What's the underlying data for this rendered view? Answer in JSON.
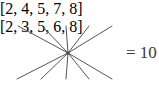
{
  "figure": {
    "width": 159,
    "height": 107,
    "background_color": "#ffffff",
    "line_color": "#555555",
    "text_color": "#2b2b2b",
    "result_color": "#3a3a3a"
  },
  "top_list": {
    "label": "[2, 4, 5, 7, 8]",
    "values": [
      2,
      4,
      5,
      7,
      8
    ]
  },
  "bottom_list": {
    "label": "[2, 3, 5, 6, 8]",
    "values": [
      2,
      3,
      5,
      6,
      8
    ]
  },
  "result": {
    "label": "= 10",
    "operator": "=",
    "value": 10
  },
  "chart_data": {
    "type": "diagram",
    "subtype": "radial-crossing-lines",
    "title": "",
    "convergence_point": {
      "x": 68,
      "y": 53
    },
    "top_anchors": [
      {
        "label": "2",
        "x": 18,
        "y": 26
      },
      {
        "label": "4",
        "x": 42,
        "y": 26
      },
      {
        "label": "5",
        "x": 66,
        "y": 26
      },
      {
        "label": "7",
        "x": 89,
        "y": 26
      },
      {
        "label": "8",
        "x": 112,
        "y": 26
      }
    ],
    "bottom_anchors": [
      {
        "label": "2",
        "x": 17,
        "y": 79
      },
      {
        "label": "3",
        "x": 41,
        "y": 79
      },
      {
        "label": "5",
        "x": 66,
        "y": 79
      },
      {
        "label": "6",
        "x": 89,
        "y": 79
      },
      {
        "label": "8",
        "x": 112,
        "y": 79
      }
    ],
    "segment_count": 10,
    "annotations": [
      "[2, 4, 5, 7, 8]",
      "[2, 3, 5, 6, 8]",
      "= 10"
    ]
  }
}
